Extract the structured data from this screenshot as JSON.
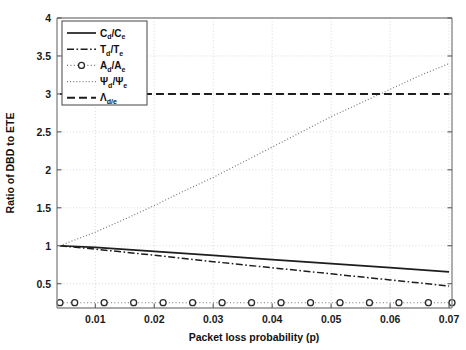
{
  "chart_data": {
    "type": "line",
    "title": "",
    "xlabel": "Packet loss probability (p)",
    "ylabel": "Ratio of DBD to ETE",
    "xlim": [
      0.0035,
      0.0705
    ],
    "ylim": [
      0.18,
      4.0
    ],
    "xticks": [
      0.01,
      0.02,
      0.03,
      0.04,
      0.05,
      0.06,
      0.07
    ],
    "xticklabels": [
      "0.01",
      "0.02",
      "0.03",
      "0.04",
      "0.05",
      "0.06",
      "0.07"
    ],
    "yticks": [
      0.5,
      1,
      1.5,
      2,
      2.5,
      3,
      3.5,
      4
    ],
    "yticklabels": [
      "0.5",
      "1",
      "1.5",
      "2",
      "2.5",
      "3",
      "3.5",
      "4"
    ],
    "grid": true,
    "legend_position": "upper left",
    "series": [
      {
        "name": "C_d/C_e",
        "legend_main": "C",
        "legend_sub_num": "d",
        "legend_den": "/C",
        "legend_sub_den": "e",
        "style": "solid",
        "x": [
          0.004,
          0.01,
          0.02,
          0.03,
          0.04,
          0.05,
          0.06,
          0.07
        ],
        "values": [
          1.0,
          0.978,
          0.925,
          0.872,
          0.818,
          0.765,
          0.711,
          0.657
        ]
      },
      {
        "name": "T_d/T_e",
        "legend_main": "T",
        "legend_sub_num": "d",
        "legend_den": "/T",
        "legend_sub_den": "e",
        "style": "dash-dot",
        "x": [
          0.004,
          0.01,
          0.02,
          0.03,
          0.04,
          0.05,
          0.06,
          0.07
        ],
        "values": [
          1.0,
          0.955,
          0.875,
          0.79,
          0.71,
          0.63,
          0.55,
          0.47
        ]
      },
      {
        "name": "A_d/A_e",
        "legend_main": "A",
        "legend_sub_num": "d",
        "legend_den": "/A",
        "legend_sub_den": "e",
        "style": "dotted-with-circle-markers",
        "x": [
          0.004,
          0.0065,
          0.0115,
          0.0165,
          0.0215,
          0.0265,
          0.0315,
          0.0365,
          0.0415,
          0.0465,
          0.0515,
          0.0565,
          0.0615,
          0.0665,
          0.0705
        ],
        "values": [
          0.25,
          0.25,
          0.25,
          0.25,
          0.25,
          0.25,
          0.25,
          0.25,
          0.25,
          0.25,
          0.25,
          0.25,
          0.25,
          0.25,
          0.25
        ]
      },
      {
        "name": "Psi_d/Psi_e",
        "legend_main": "Ψ",
        "legend_sub_num": "d",
        "legend_den": "/Ψ",
        "legend_sub_den": "e",
        "style": "dotted",
        "x": [
          0.004,
          0.01,
          0.015,
          0.02,
          0.025,
          0.03,
          0.035,
          0.04,
          0.045,
          0.05,
          0.055,
          0.06,
          0.065,
          0.07
        ],
        "values": [
          1.0,
          1.18,
          1.35,
          1.53,
          1.72,
          1.9,
          2.1,
          2.3,
          2.5,
          2.7,
          2.88,
          3.06,
          3.24,
          3.4
        ]
      },
      {
        "name": "Lambda_d/e",
        "legend_main": "Λ",
        "legend_sub_num": "d/e",
        "legend_den": "",
        "legend_sub_den": "",
        "style": "dashed",
        "x": [
          0.004,
          0.07
        ],
        "values": [
          3.0,
          3.0
        ]
      }
    ]
  }
}
